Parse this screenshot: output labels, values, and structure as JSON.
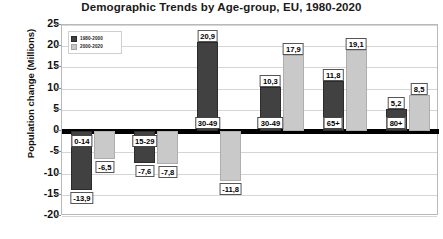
{
  "chart_data": {
    "type": "bar",
    "title": "Demographic Trends by Age-group, EU, 1980-2020",
    "xlabel": "",
    "ylabel": "Population change (Millions)",
    "ylim": [
      -20,
      25
    ],
    "yticks": [
      25,
      20,
      15,
      10,
      5,
      0,
      -5,
      -10,
      -15,
      -20
    ],
    "ytick_labels": [
      "25",
      "20",
      "15",
      "10",
      "5",
      "0",
      "-5",
      "-10",
      "-15",
      "-20"
    ],
    "grid": true,
    "legend_position": "top-left",
    "categories": [
      "0-14",
      "15-29",
      "30-49",
      "30-49",
      "65+",
      "80+"
    ],
    "category_labels": [
      "0-14",
      "15-29",
      "30-49",
      "30-49",
      "65+",
      "80+"
    ],
    "series": [
      {
        "name": "1980-2000",
        "color": "#414141",
        "values": [
          -13.9,
          -7.6,
          20.9,
          10.3,
          11.8,
          5.2
        ],
        "value_labels": [
          "-13,9",
          "-7,6",
          "20,9",
          "10,3",
          "11,8",
          "5,2"
        ]
      },
      {
        "name": "2000-2020",
        "color": "#c9c9c9",
        "values": [
          -6.5,
          -7.8,
          -11.8,
          17.9,
          19.1,
          8.5
        ],
        "value_labels": [
          "-6,5",
          "-7,8",
          "-11,8",
          "17,9",
          "19,1",
          "8,5"
        ]
      }
    ]
  }
}
